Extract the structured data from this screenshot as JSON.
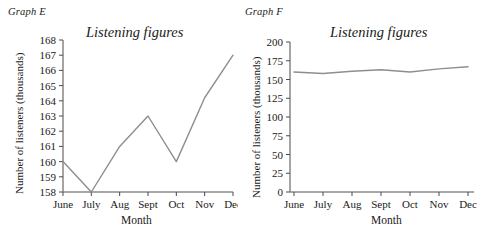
{
  "figure": {
    "background_color": "#ffffff",
    "line_color": "#8e8e8e",
    "axis_color": "#4a4a4a"
  },
  "panels": {
    "e": {
      "tag": "Graph E",
      "title": "Listening figures",
      "y_axis_title": "Number of listeners (thousands)",
      "x_axis_title": "Month"
    },
    "f": {
      "tag": "Graph F",
      "title": "Listening figures",
      "y_axis_title": "Number of listeners (thousands)",
      "x_axis_title": "Month"
    }
  },
  "chart_data": [
    {
      "type": "line",
      "title": "Listening figures",
      "panel_label": "Graph E",
      "xlabel": "Month",
      "ylabel": "Number of listeners (thousands)",
      "categories": [
        "June",
        "July",
        "Aug",
        "Sept",
        "Oct",
        "Nov",
        "Dec"
      ],
      "values": [
        160,
        158,
        161,
        163,
        160,
        164.2,
        167
      ],
      "ylim": [
        158,
        168
      ],
      "yticks": [
        158,
        159,
        160,
        161,
        162,
        163,
        164,
        165,
        166,
        167,
        168
      ],
      "ytick_labels": [
        "158",
        "159",
        "160",
        "161",
        "162",
        "163",
        "164",
        "165",
        "166",
        "167",
        "168"
      ],
      "grid": false,
      "legend": null,
      "series_color": "#8e8e8e"
    },
    {
      "type": "line",
      "title": "Listening figures",
      "panel_label": "Graph F",
      "xlabel": "Month",
      "ylabel": "Number of listeners (thousands)",
      "categories": [
        "June",
        "July",
        "Aug",
        "Sept",
        "Oct",
        "Nov",
        "Dec"
      ],
      "values": [
        160,
        158,
        161,
        163,
        160,
        164.2,
        167
      ],
      "ylim": [
        0,
        200
      ],
      "yticks": [
        0,
        25,
        50,
        75,
        100,
        125,
        150,
        175,
        200
      ],
      "ytick_labels": [
        "0",
        "25",
        "50",
        "75",
        "100",
        "125",
        "150",
        "175",
        "200"
      ],
      "grid": false,
      "legend": null,
      "series_color": "#8e8e8e"
    }
  ]
}
